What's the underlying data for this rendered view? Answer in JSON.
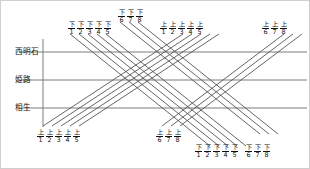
{
  "diagram": {
    "stations": [
      {
        "name": "西明石",
        "y": 51
      },
      {
        "name": "姫路",
        "y": 79
      },
      {
        "name": "相生",
        "y": 107
      }
    ],
    "colors": {
      "line": "#4a4a4a",
      "station_line": "#6e6e6e",
      "axis": "#6e6e6e",
      "text": "#111111",
      "border": "#cfcfcf",
      "background": "#ffffff"
    },
    "axis": {
      "x": 42,
      "y_top": 38,
      "y_bottom": 126
    },
    "label_groups": [
      {
        "id": "top-down-1-5",
        "direction": "下",
        "numbers": [
          "1",
          "2",
          "3",
          "4",
          "5"
        ],
        "x": 67,
        "y": 20,
        "position": "top"
      },
      {
        "id": "top-down-6-8",
        "direction": "下",
        "numbers": [
          "6",
          "7",
          "8"
        ],
        "x": 117,
        "y": 8,
        "position": "top"
      },
      {
        "id": "top-up-1-5",
        "direction": "上",
        "numbers": [
          "1",
          "2",
          "3",
          "4",
          "5"
        ],
        "x": 159,
        "y": 20,
        "position": "top"
      },
      {
        "id": "top-up-6-8",
        "direction": "上",
        "numbers": [
          "6",
          "7",
          "8"
        ],
        "x": 261,
        "y": 20,
        "position": "top"
      },
      {
        "id": "bottom-up-1-5",
        "direction": "上",
        "numbers": [
          "1",
          "2",
          "3",
          "4",
          "5"
        ],
        "x": 36,
        "y": 128,
        "position": "bottom"
      },
      {
        "id": "bottom-up-6-8",
        "direction": "上",
        "numbers": [
          "6",
          "7",
          "8"
        ],
        "x": 155,
        "y": 128,
        "position": "bottom"
      },
      {
        "id": "bottom-down-1-5",
        "direction": "下",
        "numbers": [
          "1",
          "2",
          "3",
          "4",
          "5"
        ],
        "x": 194,
        "y": 143,
        "position": "bottom"
      },
      {
        "id": "bottom-down-6-8",
        "direction": "下",
        "numbers": [
          "6",
          "7",
          "8"
        ],
        "x": 244,
        "y": 143,
        "position": "bottom"
      }
    ],
    "train_paths": {
      "down_1_5": [
        {
          "id": "下1",
          "x1": 69,
          "y1": 33,
          "x2": 209,
          "y2": 145
        },
        {
          "id": "下2",
          "x1": 78,
          "y1": 33,
          "x2": 218,
          "y2": 145
        },
        {
          "id": "下3",
          "x1": 87,
          "y1": 33,
          "x2": 227,
          "y2": 145
        },
        {
          "id": "下4",
          "x1": 96,
          "y1": 33,
          "x2": 236,
          "y2": 145
        },
        {
          "id": "下5",
          "x1": 105,
          "y1": 33,
          "x2": 245,
          "y2": 145
        }
      ],
      "down_6_8": [
        {
          "id": "下6",
          "x1": 119,
          "y1": 21,
          "x2": 259,
          "y2": 133
        },
        {
          "id": "下7",
          "x1": 128,
          "y1": 21,
          "x2": 268,
          "y2": 133
        },
        {
          "id": "下8",
          "x1": 137,
          "y1": 21,
          "x2": 277,
          "y2": 133
        }
      ],
      "up_1_5": [
        {
          "id": "上1",
          "x1": 42,
          "y1": 125,
          "x2": 182,
          "y2": 33
        },
        {
          "id": "上2",
          "x1": 51,
          "y1": 125,
          "x2": 191,
          "y2": 33
        },
        {
          "id": "上3",
          "x1": 60,
          "y1": 125,
          "x2": 200,
          "y2": 33
        },
        {
          "id": "上4",
          "x1": 69,
          "y1": 125,
          "x2": 209,
          "y2": 33
        },
        {
          "id": "上5",
          "x1": 78,
          "y1": 125,
          "x2": 218,
          "y2": 33
        }
      ],
      "up_6_8": [
        {
          "id": "上6",
          "x1": 161,
          "y1": 125,
          "x2": 283,
          "y2": 33
        },
        {
          "id": "上7",
          "x1": 170,
          "y1": 125,
          "x2": 292,
          "y2": 33
        },
        {
          "id": "上8",
          "x1": 179,
          "y1": 125,
          "x2": 301,
          "y2": 33
        }
      ]
    },
    "station_line_extent": {
      "x_start": 18,
      "x_end": 306
    }
  }
}
